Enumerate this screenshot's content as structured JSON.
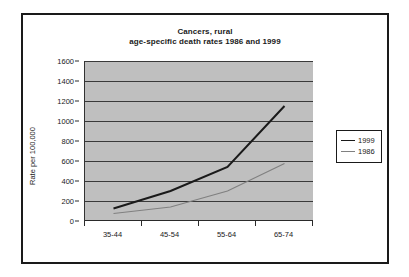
{
  "chart_data": {
    "type": "line",
    "title": "Cancers, rural age-specific death rates 1986 and 1999",
    "title_lines": [
      "Cancers, rural",
      "age-specific death rates 1986 and 1999"
    ],
    "xlabel": "",
    "ylabel": "Rate per 100,000",
    "categories": [
      "35-44",
      "45-54",
      "55-64",
      "65-74"
    ],
    "ylim": [
      0,
      1600
    ],
    "ytick_step": 200,
    "yticks": [
      {
        "value": 1600,
        "label": "1600"
      },
      {
        "value": 1400,
        "label": "1400"
      },
      {
        "value": 1200,
        "label": "1200"
      },
      {
        "value": 1000,
        "label": "1000"
      },
      {
        "value": 800,
        "label": "800"
      },
      {
        "value": 600,
        "label": "600"
      },
      {
        "value": 400,
        "label": "400"
      },
      {
        "value": 200,
        "label": "200"
      },
      {
        "value": 0,
        "label": "0"
      }
    ],
    "grid": true,
    "legend_position": "right",
    "plot_background": "#bfbfbf",
    "series": [
      {
        "name": "1999",
        "color": "#1a1a1a",
        "values": [
          125,
          300,
          540,
          1150
        ]
      },
      {
        "name": "1986",
        "color": "#808080",
        "values": [
          75,
          140,
          300,
          575
        ]
      }
    ]
  },
  "legend": {
    "entries": [
      {
        "label": "1999",
        "color": "#1a1a1a"
      },
      {
        "label": "1986",
        "color": "#808080"
      }
    ]
  }
}
